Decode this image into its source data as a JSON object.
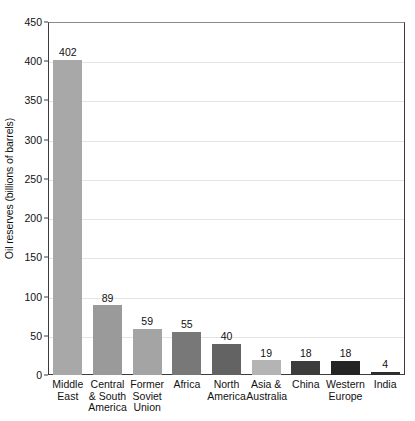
{
  "chart_data": {
    "type": "bar",
    "title": "",
    "xlabel": "",
    "ylabel": "Oil reserves (billions of barrels)",
    "ylim": [
      0,
      450
    ],
    "ytick_step": 50,
    "yticks": [
      "450",
      "400",
      "350",
      "300",
      "250",
      "200",
      "150",
      "100",
      "50",
      "0"
    ],
    "grid": true,
    "legend": "none",
    "categories": [
      "Middle East",
      "Central & South America",
      "Former Soviet Union",
      "Africa",
      "North America",
      "Asia & Australia",
      "China",
      "Western Europe",
      "India"
    ],
    "category_lines": [
      [
        "Middle",
        "East"
      ],
      [
        "Central",
        "& South",
        "America"
      ],
      [
        "Former",
        "Soviet",
        "Union"
      ],
      [
        "Africa"
      ],
      [
        "North",
        "America"
      ],
      [
        "Asia &",
        "Australia"
      ],
      [
        "China"
      ],
      [
        "Western",
        "Europe"
      ],
      [
        "India"
      ]
    ],
    "values": [
      402,
      89,
      59,
      55,
      40,
      19,
      18,
      18,
      4
    ],
    "value_labels": [
      "402",
      "89",
      "59",
      "55",
      "40",
      "19",
      "18",
      "18",
      "4"
    ],
    "bar_colors": [
      "#a8a8a8",
      "#9a9a9a",
      "#a4a4a4",
      "#787878",
      "#636363",
      "#b4b4b4",
      "#3c3c3c",
      "#242424",
      "#2e2e2e"
    ]
  },
  "axis": {
    "ylabel": "Oil reserves (billions of barrels)"
  }
}
